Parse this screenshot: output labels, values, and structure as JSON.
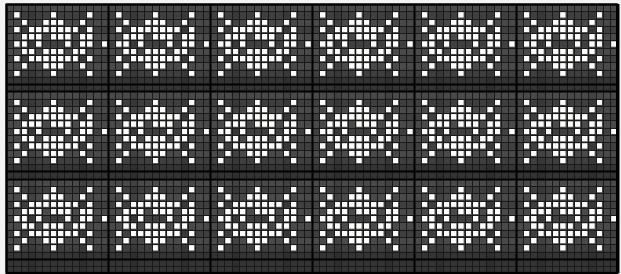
{
  "document": {
    "kind": "pattern-chart",
    "title": "",
    "description": "Monochrome grid pattern chart: repeating diamond medallion motifs in three horizontal bands"
  },
  "canvas": {
    "width": 621,
    "height": 274,
    "page_background": "#f3f3f1"
  },
  "chart_data": {
    "type": "heatmap",
    "title": "",
    "subtitle": "",
    "xlabel": "",
    "ylabel": "",
    "grid": true,
    "legend_position": "none",
    "colors": {
      "filled": "#fdfdfb",
      "empty_light": "#4a4a4a",
      "empty_mid": "#3f3f3f",
      "empty_dark": "#343434",
      "gridline_thin": "#1a1a1a",
      "gridline_thick": "#000000",
      "border": "#000000"
    },
    "cell": {
      "width": 7.28,
      "height": 7.28,
      "thin_line_width": 1,
      "thick_line_width": 2
    },
    "origin": {
      "x": 6,
      "y": 4
    },
    "cols": 84,
    "rows": 37,
    "motif": {
      "repeat_cols": 14,
      "repeat_rows": 12,
      "horizontal_repeats": 6,
      "bands": 3,
      "band_row_starts": [
        0,
        12,
        24
      ],
      "band_height_rows": 12
    },
    "thick_columns": [
      0,
      14,
      28,
      42,
      56,
      70,
      84
    ],
    "thick_rows": [
      0,
      11,
      12,
      23,
      24,
      35,
      37
    ],
    "x_tick_labels": [],
    "y_tick_labels": [],
    "annotations": [],
    "axis_ranges": {
      "xlim": [
        0,
        84
      ],
      "ylim": [
        0,
        37
      ]
    },
    "legend_entries": [],
    "motif_matrix_rows": [
      "00000000000000",
      "01000010000100",
      "00100111001000",
      "01011111110100",
      "00111011101100",
      "01101000101101",
      "00110111011000",
      "01011111110100",
      "00100111001000",
      "01000010000100",
      "00000000000000",
      "00000000000000"
    ],
    "shading_rows_dark": [
      10,
      11,
      22,
      23,
      34,
      35,
      36
    ],
    "values_note": "1 = filled (white) stitch, 0 = empty (dark) ground"
  }
}
